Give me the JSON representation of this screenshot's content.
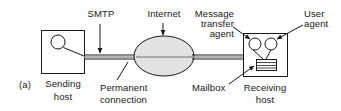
{
  "figure": {
    "panel_label": "(a)",
    "type": "diagram"
  },
  "labels": {
    "smtp": "SMTP",
    "internet": "Internet",
    "message_transfer_agent": "Message\ntransfer\nagent",
    "message_transfer_agent_line1": "Message",
    "message_transfer_agent_line2": "transfer",
    "message_transfer_agent_line3": "agent",
    "user_agent_line1": "User",
    "user_agent_line2": "agent",
    "sending_host_line1": "Sending",
    "sending_host_line2": "host",
    "permanent_connection_line1": "Permanent",
    "permanent_connection_line2": "connection",
    "mailbox": "Mailbox",
    "receiving_host_line1": "Receiving",
    "receiving_host_line2": "host"
  },
  "colors": {
    "stroke": "#1a1a1a",
    "cloud_fill": "#e2e2e2",
    "background": "#fdfdfd",
    "text": "#1a1a1a"
  },
  "shapes": {
    "sending_host_box": {
      "x": 41,
      "y": 30,
      "w": 43,
      "h": 43
    },
    "sending_host_circle": {
      "cx": 58,
      "cy": 42,
      "r": 7
    },
    "internet_cloud": {
      "cx": 164,
      "cy": 56,
      "rx": 30,
      "ry": 20
    },
    "receiving_host_box": {
      "x": 243,
      "y": 33,
      "w": 44,
      "h": 43
    },
    "mta_circle": {
      "cx": 255,
      "cy": 44,
      "r": 6
    },
    "ua_circle": {
      "cx": 271,
      "cy": 44,
      "r": 6
    },
    "mailbox_rect": {
      "x": 256,
      "y": 59,
      "w": 20,
      "h": 11
    },
    "connection_line_y": 57
  }
}
